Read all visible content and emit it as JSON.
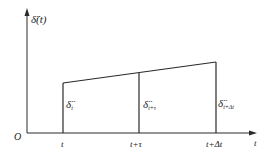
{
  "diagram": {
    "y_axis_label": "δ̈(t)",
    "x_axis_label": "t",
    "origin_label": "O",
    "ticks": [
      {
        "label": "t",
        "x": 63
      },
      {
        "label": "t+τ",
        "x": 139
      },
      {
        "label": "t+Δt",
        "x": 216
      }
    ],
    "values": [
      {
        "symbol": "δ̈",
        "subscript": "t",
        "x": 63,
        "top_y": 83
      },
      {
        "symbol": "δ̈",
        "subscript": "t+τ",
        "x": 139,
        "top_y": 73
      },
      {
        "symbol": "δ̈",
        "subscript": "t+Δt",
        "x": 216,
        "top_y": 62
      }
    ],
    "line_color": "#2a2a2a"
  }
}
